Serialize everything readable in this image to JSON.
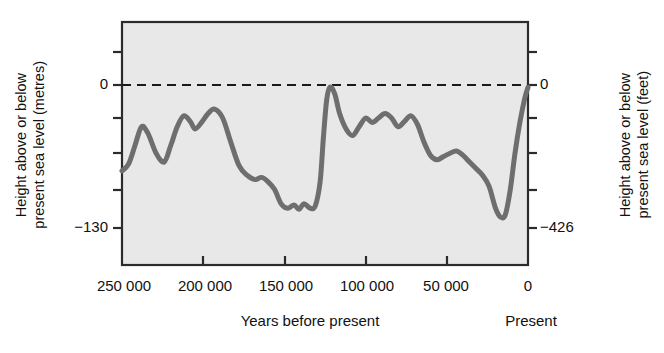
{
  "figure": {
    "background": "#ffffff",
    "plot_background": "#e8e8e8",
    "axis_color": "#2b2b2b",
    "curve_color": "#6e6e6e"
  },
  "axis_titles": {
    "left_line1": "Height above or below",
    "left_line2": "present sea level (metres)",
    "right_line1": "Height above or below",
    "right_line2": "present sea level (feet)",
    "x_title": "Years before present",
    "x_right_label": "Present"
  },
  "annotations": {
    "sea_level_note": "Today's sea level"
  },
  "ticks": {
    "x_labels": [
      "250 000",
      "200 000",
      "150 000",
      "100 000",
      "50 000",
      "0"
    ],
    "y_left_labels": [
      "0",
      "−130"
    ],
    "y_right_labels": [
      "0",
      "−426"
    ]
  },
  "chart_data": {
    "type": "line",
    "title": "",
    "subtitle": "",
    "xlabel": "Years before present",
    "ylabel": "Height above or below present sea level (metres)",
    "ylabel_right": "Height above or below present sea level (feet)",
    "xlim": [
      250000,
      0
    ],
    "ylim": [
      -142,
      12
    ],
    "ylim_right_feet": [
      -466,
      39
    ],
    "x_ticks": [
      250000,
      200000,
      150000,
      100000,
      50000,
      0
    ],
    "x_tick_labels": [
      "250 000",
      "200 000",
      "150 000",
      "100 000",
      "50 000",
      "0"
    ],
    "y_ticks_left": [
      0,
      -130
    ],
    "y_tick_labels_left": [
      "0",
      "−130"
    ],
    "y_ticks_right": [
      0,
      -426
    ],
    "y_tick_labels_right": [
      "0",
      "−426"
    ],
    "y_minor_ticks_left": [
      -20,
      -45,
      -65,
      -90,
      -110
    ],
    "y_minor_ticks_right": [
      -65,
      -130,
      -200,
      -265,
      -330
    ],
    "grid": false,
    "legend": "none",
    "annotations": [
      {
        "text": "Today's sea level",
        "x": 238000,
        "y": 14,
        "type": "text"
      },
      {
        "text": "Today's sea level reference line",
        "type": "hline",
        "y": 0,
        "style": "dashed"
      }
    ],
    "series": [
      {
        "name": "Sea level",
        "units": "metres relative to present",
        "x": [
          250000,
          246000,
          242000,
          238000,
          234000,
          229000,
          224000,
          220000,
          216000,
          212000,
          208000,
          205000,
          201000,
          197000,
          193000,
          188000,
          183000,
          178000,
          173000,
          168000,
          164000,
          160000,
          156000,
          152000,
          148000,
          144000,
          141000,
          138000,
          134000,
          131000,
          128000,
          126000,
          124000,
          122000,
          119000,
          116000,
          112000,
          108000,
          104000,
          100000,
          96000,
          92000,
          88000,
          84000,
          80000,
          76000,
          72000,
          68000,
          64000,
          60000,
          56000,
          52000,
          48000,
          44000,
          40000,
          36000,
          32000,
          28000,
          24000,
          20000,
          17000,
          14000,
          11000,
          8000,
          5000,
          2000,
          0
        ],
        "y": [
          -78,
          -72,
          -55,
          -38,
          -44,
          -62,
          -70,
          -55,
          -38,
          -28,
          -33,
          -40,
          -34,
          -26,
          -22,
          -30,
          -52,
          -73,
          -82,
          -86,
          -84,
          -88,
          -95,
          -108,
          -112,
          -109,
          -113,
          -108,
          -112,
          -110,
          -88,
          -48,
          -14,
          -2,
          -8,
          -26,
          -40,
          -46,
          -38,
          -30,
          -34,
          -30,
          -26,
          -30,
          -38,
          -33,
          -28,
          -36,
          -52,
          -64,
          -68,
          -65,
          -62,
          -60,
          -64,
          -70,
          -76,
          -82,
          -92,
          -112,
          -120,
          -118,
          -96,
          -62,
          -34,
          -12,
          -2
        ]
      }
    ]
  }
}
